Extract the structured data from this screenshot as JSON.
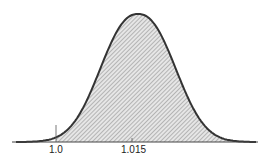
{
  "chart_data": {
    "type": "area",
    "title": "",
    "xlabel": "",
    "ylabel": "",
    "distribution": {
      "mean": 1.015,
      "shape": "normal"
    },
    "tick_labels": [
      "1.0",
      "1.015"
    ],
    "shaded_region": {
      "from": 1.0,
      "to": "+inf"
    },
    "grid": false,
    "colors": {
      "curve": "#333333",
      "hatch": "#888888",
      "axis": "#444444"
    }
  },
  "labels": {
    "x1": "1.0",
    "x2": "1.015"
  }
}
